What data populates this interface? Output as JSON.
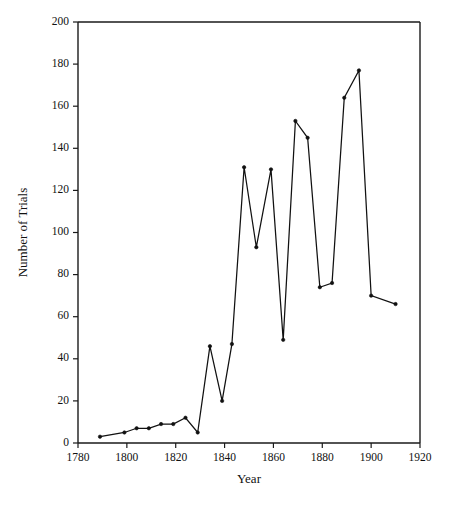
{
  "chart_data": {
    "type": "line",
    "title": "",
    "xlabel": "Year",
    "ylabel": "Number of Trials",
    "xlim": [
      1780,
      1920
    ],
    "ylim": [
      0,
      200
    ],
    "grid": false,
    "legend": false,
    "legend_position": "none",
    "x_ticks": [
      1780,
      1800,
      1820,
      1840,
      1860,
      1880,
      1900,
      1920
    ],
    "y_ticks": [
      0,
      20,
      40,
      60,
      80,
      100,
      120,
      140,
      160,
      180,
      200
    ],
    "x_tick_labels": [
      "1780",
      "1800",
      "1820",
      "1840",
      "1860",
      "1880",
      "1900",
      "1920"
    ],
    "y_tick_labels": [
      "0",
      "20",
      "40",
      "60",
      "80",
      "100",
      "120",
      "140",
      "160",
      "180",
      "200"
    ],
    "series": [
      {
        "name": "Number of Trials",
        "color": "#111111",
        "marker": "point",
        "x": [
          1789,
          1799,
          1804,
          1809,
          1814,
          1819,
          1824,
          1829,
          1834,
          1839,
          1843,
          1848,
          1853,
          1859,
          1864,
          1869,
          1874,
          1879,
          1884,
          1889,
          1895,
          1900,
          1910
        ],
        "values": [
          3,
          5,
          7,
          7,
          9,
          9,
          12,
          5,
          46,
          20,
          47,
          131,
          93,
          130,
          49,
          153,
          145,
          74,
          76,
          164,
          177,
          70,
          66
        ]
      }
    ]
  },
  "axes": {
    "x_axis_label": "Year",
    "y_axis_label": "Number of Trials"
  }
}
